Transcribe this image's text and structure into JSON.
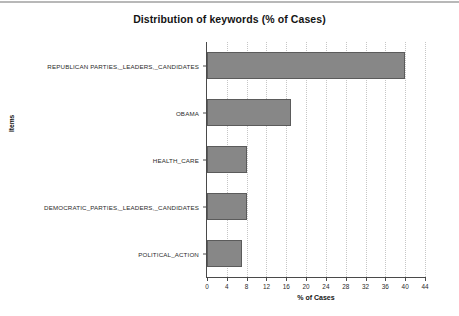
{
  "chart_data": {
    "type": "bar",
    "orientation": "horizontal",
    "title": "Distribution of keywords (% of Cases)",
    "xlabel": "% of Cases",
    "ylabel": "Items",
    "categories": [
      "REPUBLICAN PARTIES,_LEADERS,_CANDIDATES",
      "OBAMA",
      "HEALTH_CARE",
      "DEMOCRATIC_PARTIES,_LEADERS,_CANDIDATES",
      "POLITICAL_ACTION"
    ],
    "values": [
      40,
      17,
      8,
      8,
      7
    ],
    "xlim": [
      0,
      44
    ],
    "xticks": [
      "0",
      "4",
      "8",
      "12",
      "16",
      "20",
      "24",
      "28",
      "32",
      "36",
      "40",
      "44"
    ],
    "xtick_values": [
      0,
      4,
      8,
      12,
      16,
      20,
      24,
      28,
      32,
      36,
      40,
      44
    ],
    "grid": "vertical-dotted",
    "legend": null,
    "bar_fill_color": "#878787",
    "bar_border_color": "#5b5b5b",
    "background_color": "#ffffff",
    "grid_color": "#c6c6c6",
    "axis_color": "#4a4a4a"
  }
}
